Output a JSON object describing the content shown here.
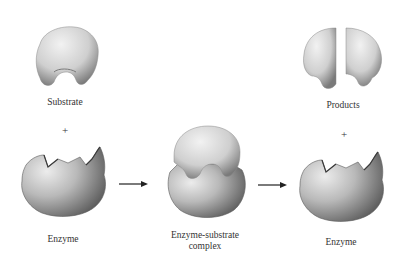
{
  "diagram": {
    "labels": {
      "substrate": "Substrate",
      "plus_left": "+",
      "enzyme_left": "Enzyme",
      "complex_line1": "Enzyme-substrate",
      "complex_line2": "complex",
      "products": "Products",
      "plus_right": "+",
      "enzyme_right": "Enzyme"
    },
    "flow": [
      "Substrate + Enzyme",
      "Enzyme-substrate complex",
      "Products + Enzyme"
    ],
    "colors": {
      "shape_light": "#e6e6e6",
      "shape_mid": "#b5b5b5",
      "shape_dark": "#6e6e6e",
      "arrow": "#222222",
      "text": "#333333"
    }
  }
}
